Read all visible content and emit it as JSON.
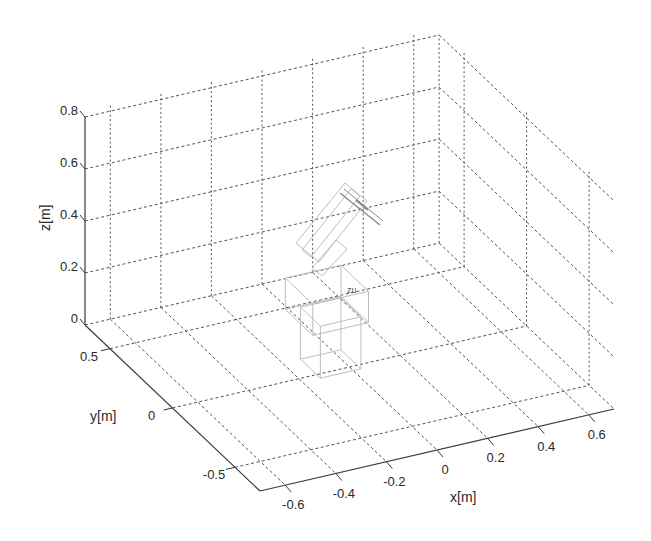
{
  "chart_data": {
    "type": "3d-wireframe",
    "title": "",
    "xlabel": "x[m]",
    "ylabel": "y[m]",
    "zlabel": "z[m]",
    "xlim": [
      -0.7,
      0.7
    ],
    "ylim": [
      -0.7,
      0.7
    ],
    "zlim": [
      0,
      0.8
    ],
    "xticks": [
      -0.6,
      -0.4,
      -0.2,
      0,
      0.2,
      0.4,
      0.6
    ],
    "xtick_labels": [
      "-0.6",
      "-0.4",
      "-0.2",
      "0",
      "0.2",
      "0.4",
      "0.6"
    ],
    "yticks": [
      0.5,
      0,
      -0.5
    ],
    "ytick_labels": [
      "0.5",
      "0",
      "-0.5"
    ],
    "zticks": [
      0,
      0.2,
      0.4,
      0.6,
      0.8
    ],
    "ztick_labels": [
      "0",
      "0.2",
      "0.4",
      "0.6",
      "0.8"
    ],
    "grid": true,
    "grid_style": "dotted",
    "annotations": [
      {
        "text": "zu",
        "x": 0,
        "y": 0.15,
        "z": 0.2
      }
    ],
    "objects": [
      {
        "name": "robot-base",
        "kind": "box",
        "style": "light-gray wireframe"
      },
      {
        "name": "robot-upper-block",
        "kind": "box",
        "style": "light-gray wireframe"
      },
      {
        "name": "robot-arm-link",
        "kind": "tilted-box",
        "style": "light-gray wireframe"
      },
      {
        "name": "robot-end-effector",
        "kind": "tool",
        "style": "gray wireframe"
      }
    ],
    "legend": null
  },
  "colors": {
    "axis": "#3a3a3a",
    "grid": "#555555",
    "robot": "#bdbdbd",
    "robot_dark": "#8a8a8a",
    "text": "#2a2a2a"
  }
}
